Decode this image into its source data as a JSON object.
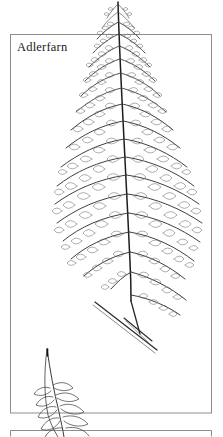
{
  "plate": {
    "label": "Adlerfarn",
    "label_lang": "de",
    "medium": "line-art botanical illustration",
    "subject": "bracken fern frond",
    "ink_color": "#2b2b2b",
    "line_color": "#555555",
    "frame_color": "#8a8a8a",
    "background_color": "#ffffff"
  },
  "frames": [
    {
      "name": "main-frame",
      "x": 10,
      "y": 34,
      "width": 202,
      "height": 379
    },
    {
      "name": "lower-frame",
      "x": 10,
      "y": 430,
      "width": 202,
      "height": 7
    }
  ],
  "figures": [
    {
      "name": "main-frond",
      "description": "large bracken fern frond, tip above frame top, rachis running top-centre to lower-centre",
      "tip": {
        "x": 118,
        "y": 0
      },
      "base": {
        "x": 131,
        "y": 300
      },
      "pinna_pairs": 16
    },
    {
      "name": "stipe",
      "description": "diagonal stem crossing below frond base",
      "from": {
        "x": 95,
        "y": 302
      },
      "to": {
        "x": 158,
        "y": 350
      }
    },
    {
      "name": "young-frond",
      "description": "small emerging frond at lower left crossing the frame bottom edge",
      "tip": {
        "x": 47,
        "y": 348
      },
      "base": {
        "x": 62,
        "y": 437
      }
    }
  ]
}
